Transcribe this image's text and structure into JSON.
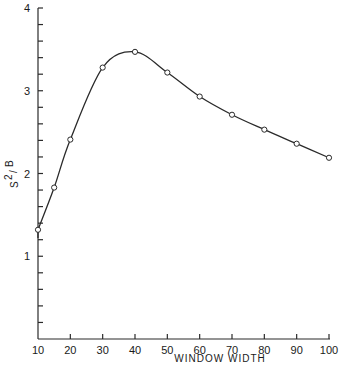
{
  "chart_data": {
    "type": "line",
    "title": "",
    "xlabel": "WINDOW WIDTH",
    "ylabel": "S²/B",
    "ylabel_parts": {
      "base": "S",
      "sup": "2",
      "slash": "/",
      "den": "B"
    },
    "xlim": [
      10,
      100
    ],
    "ylim": [
      0,
      4
    ],
    "x_ticks": [
      10,
      20,
      30,
      40,
      50,
      60,
      70,
      80,
      90,
      100
    ],
    "y_ticks_labeled": [
      1,
      2,
      3,
      4
    ],
    "y_minor_tick_step": 0.2,
    "grid": false,
    "legend": null,
    "markers": "open-circle",
    "smooth_curve": true,
    "series": [
      {
        "name": "S²/B",
        "x": [
          10,
          15,
          20,
          30,
          40,
          50,
          60,
          70,
          80,
          90,
          100
        ],
        "values": [
          1.32,
          1.83,
          2.41,
          3.28,
          3.47,
          3.22,
          2.93,
          2.71,
          2.53,
          2.36,
          2.19
        ]
      }
    ]
  }
}
